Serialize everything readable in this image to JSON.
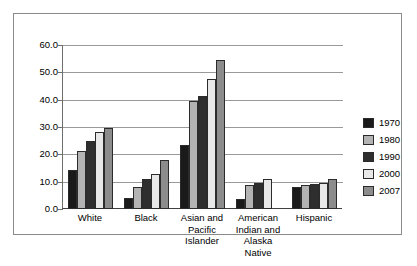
{
  "chart_data": {
    "type": "bar",
    "title": "",
    "subtitle": "",
    "xlabel": "",
    "ylabel": "",
    "ylim": [
      0.0,
      60.0
    ],
    "ytick_labels": [
      "60.0",
      "50.0",
      "40.0",
      "30.0",
      "20.0",
      "10.0",
      "0.0"
    ],
    "ytick_values": [
      60.0,
      50.0,
      40.0,
      30.0,
      20.0,
      10.0,
      0.0
    ],
    "grid": "horizontal",
    "legend_position": "right",
    "categories": [
      "White",
      "Asian and Pacific Islander",
      "Black",
      "American Indian and Alaska Native",
      "Hispanic"
    ],
    "category_display": [
      [
        "White"
      ],
      [
        "Black"
      ],
      [
        "Asian and",
        "Pacific",
        "Islander"
      ],
      [
        "American",
        "Indian and",
        "Alaska",
        "Native"
      ],
      [
        "Hispanic"
      ]
    ],
    "category_order": [
      "White",
      "Black",
      "Asian and Pacific Islander",
      "American Indian and Alaska Native",
      "Hispanic"
    ],
    "series": [
      {
        "name": "1970",
        "color": "#1a1a1a",
        "values": [
          14.3,
          4.1,
          23.3,
          3.8,
          7.9
        ]
      },
      {
        "name": "1980",
        "color": "#b3b3b3",
        "values": [
          21.3,
          8.0,
          39.4,
          8.7,
          8.9
        ]
      },
      {
        "name": "1990",
        "color": "#2e2e2e",
        "values": [
          24.8,
          10.8,
          41.4,
          9.4,
          9.0
        ]
      },
      {
        "name": "2000",
        "color": "#e8e8e8",
        "values": [
          28.1,
          12.8,
          47.5,
          10.8,
          9.4
        ]
      },
      {
        "name": "2007",
        "color": "#8c8c8c",
        "values": [
          29.8,
          17.8,
          54.5,
          null,
          10.9
        ]
      }
    ]
  },
  "legend": {
    "items": [
      {
        "label": "1970",
        "color": "#1a1a1a"
      },
      {
        "label": "1980",
        "color": "#b3b3b3"
      },
      {
        "label": "1990",
        "color": "#2e2e2e"
      },
      {
        "label": "2000",
        "color": "#e8e8e8"
      },
      {
        "label": "2007",
        "color": "#8c8c8c"
      }
    ]
  },
  "style": {
    "frame_border": "#8a8a8a",
    "gridline": "#9a9a9a",
    "axis": "#404040",
    "background": "#ffffff",
    "bar_outline": "#2b2b2b"
  }
}
